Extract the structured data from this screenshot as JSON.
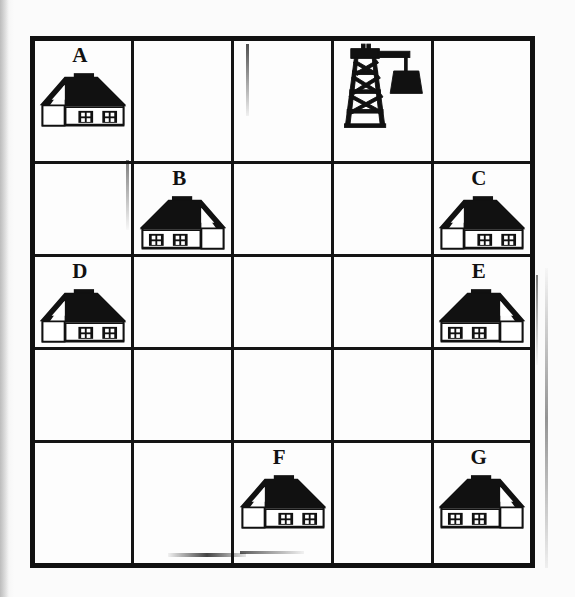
{
  "figure": {
    "kind": "grid-map",
    "background_color": "#fbfbfb",
    "line_color": "#141414",
    "columns": 5,
    "rows": 5
  },
  "grid": {
    "rows": [
      {
        "cells": [
          {
            "label": "A",
            "icon": "house-icon",
            "icon_variant": "gable-left",
            "label_align": "left"
          },
          {
            "label": "",
            "icon": "",
            "icon_variant": "",
            "label_align": "left"
          },
          {
            "label": "",
            "icon": "",
            "icon_variant": "",
            "label_align": "left"
          },
          {
            "label": "",
            "icon": "crane-tower-icon",
            "icon_variant": "derrick",
            "label_align": "left"
          },
          {
            "label": "",
            "icon": "",
            "icon_variant": "",
            "label_align": "left"
          }
        ]
      },
      {
        "cells": [
          {
            "label": "",
            "icon": "",
            "icon_variant": "",
            "label_align": "left"
          },
          {
            "label": "B",
            "icon": "house-icon",
            "icon_variant": "gable-right",
            "label_align": "left"
          },
          {
            "label": "",
            "icon": "",
            "icon_variant": "",
            "label_align": "left"
          },
          {
            "label": "",
            "icon": "",
            "icon_variant": "",
            "label_align": "left"
          },
          {
            "label": "C",
            "icon": "house-icon",
            "icon_variant": "gable-left",
            "label_align": "left"
          }
        ]
      },
      {
        "cells": [
          {
            "label": "D",
            "icon": "house-icon",
            "icon_variant": "gable-left",
            "label_align": "left"
          },
          {
            "label": "",
            "icon": "",
            "icon_variant": "",
            "label_align": "left"
          },
          {
            "label": "",
            "icon": "",
            "icon_variant": "",
            "label_align": "left"
          },
          {
            "label": "",
            "icon": "",
            "icon_variant": "",
            "label_align": "left"
          },
          {
            "label": "E",
            "icon": "house-icon",
            "icon_variant": "gable-right",
            "label_align": "left"
          }
        ]
      },
      {
        "cells": [
          {
            "label": "",
            "icon": "",
            "icon_variant": "",
            "label_align": "left"
          },
          {
            "label": "",
            "icon": "",
            "icon_variant": "",
            "label_align": "left"
          },
          {
            "label": "",
            "icon": "",
            "icon_variant": "",
            "label_align": "left"
          },
          {
            "label": "",
            "icon": "",
            "icon_variant": "",
            "label_align": "left"
          },
          {
            "label": "",
            "icon": "",
            "icon_variant": "",
            "label_align": "left"
          }
        ]
      },
      {
        "cells": [
          {
            "label": "",
            "icon": "",
            "icon_variant": "",
            "label_align": "left"
          },
          {
            "label": "",
            "icon": "",
            "icon_variant": "",
            "label_align": "left"
          },
          {
            "label": "F",
            "icon": "house-icon",
            "icon_variant": "gable-left",
            "label_align": "left"
          },
          {
            "label": "",
            "icon": "",
            "icon_variant": "",
            "label_align": "left"
          },
          {
            "label": "G",
            "icon": "house-icon",
            "icon_variant": "gable-right",
            "label_align": "left"
          }
        ]
      }
    ]
  },
  "legend": {
    "house_label": "house",
    "crane_label": "crane tower",
    "markers": [
      "A",
      "B",
      "C",
      "D",
      "E",
      "F",
      "G"
    ]
  }
}
